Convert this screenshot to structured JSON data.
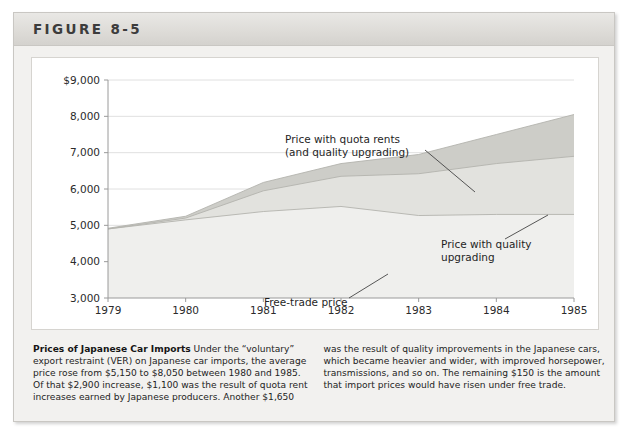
{
  "figure": {
    "label": "FIGURE 8-5"
  },
  "caption": {
    "lead": "Prices of Japanese Car Imports",
    "left_lines": [
      "Under the “voluntary”",
      "export restraint (VER) on Japanese car imports, the average",
      "price rose from $5,150 to $8,050 between 1980 and 1985.",
      "Of that $2,900 increase, $1,100 was the result of quota rent",
      "increases earned by Japanese producers. Another $1,650"
    ],
    "right_lines": [
      "was the result of quality improvements in the Japanese cars,",
      "which became heavier and wider, with improved horsepower,",
      "transmissions, and so on. The remaining $150 is the amount",
      "that import prices would have risen under free trade."
    ]
  },
  "chart_data": {
    "type": "area",
    "title": "Prices of Japanese Car Imports",
    "xlabel": "",
    "ylabel": "",
    "x": [
      1979,
      1980,
      1981,
      1982,
      1983,
      1984,
      1985
    ],
    "xticklabels": [
      "1979",
      "1980",
      "1981",
      "1982",
      "1983",
      "1984",
      "1985"
    ],
    "yticks": [
      3000,
      4000,
      5000,
      6000,
      7000,
      8000,
      9000
    ],
    "yticklabels": [
      "3,000",
      "4,000",
      "5,000",
      "6,000",
      "7,000",
      "8,000",
      "$9,000"
    ],
    "ylim": [
      3000,
      9000
    ],
    "xlim": [
      1979,
      1985
    ],
    "grid": "horizontal",
    "legend": "annotations",
    "series": [
      {
        "name": "Free-trade price",
        "values": [
          4900,
          5150,
          5380,
          5520,
          5270,
          5300,
          5300
        ],
        "color": "#efefed"
      },
      {
        "name": "Price with quality upgrading",
        "values": [
          4900,
          5200,
          5950,
          6350,
          6420,
          6700,
          6900
        ],
        "color": "#e2e2de"
      },
      {
        "name": "Price with quota rents (and quality upgrading)",
        "values": [
          4920,
          5250,
          6180,
          6700,
          6950,
          7500,
          8050
        ],
        "color": "#cdcdc8"
      }
    ],
    "annotations": [
      {
        "name": "annotation-quota-rents",
        "lines": [
          "Price with quota rents",
          "(and quality upgrading)"
        ],
        "text_x": 253,
        "text_y": 85,
        "leader": {
          "x1": 393,
          "y1": 92,
          "x2": 443,
          "y2": 134
        }
      },
      {
        "name": "annotation-quality-upgrading",
        "lines": [
          "Price with quality",
          "upgrading"
        ],
        "text_x": 409,
        "text_y": 190,
        "leader": {
          "x1": 473,
          "y1": 181,
          "x2": 516,
          "y2": 157
        }
      },
      {
        "name": "annotation-free-trade-price",
        "lines": [
          "Free-trade price"
        ],
        "text_x": 232,
        "text_y": 248,
        "leader": {
          "x1": 317,
          "y1": 240,
          "x2": 356,
          "y2": 216
        }
      }
    ]
  }
}
